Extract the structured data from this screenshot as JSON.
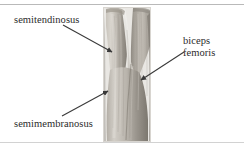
{
  "figure": {
    "kind": "anatomy-illustration",
    "background_color": "#ffffff",
    "frame_color": "#b9b9b9"
  },
  "labels": {
    "semitendinosus": "semitendinosus",
    "semimembranosus": "semimembranosus",
    "biceps_femoris_line1": "biceps",
    "biceps_femoris_line2": "femoris"
  },
  "leaders": [
    {
      "name": "leader-semitendinosus",
      "from": [
        63,
        25
      ],
      "to": [
        112,
        52
      ],
      "color": "#3a3a3a"
    },
    {
      "name": "leader-semimembranosus",
      "from": [
        62,
        116
      ],
      "to": [
        108,
        91
      ],
      "color": "#3a3a3a"
    },
    {
      "name": "leader-biceps-femoris",
      "from": [
        184,
        52
      ],
      "to": [
        141,
        80
      ],
      "color": "#3a3a3a"
    }
  ],
  "specimen": {
    "name": "hamstring-muscle-photo",
    "bounds": [
      103,
      7,
      48,
      135
    ],
    "tones": {
      "light": "#d6d2cb",
      "mid": "#b4afa7",
      "dark": "#8d887f",
      "shadow": "#6f6a62"
    }
  }
}
